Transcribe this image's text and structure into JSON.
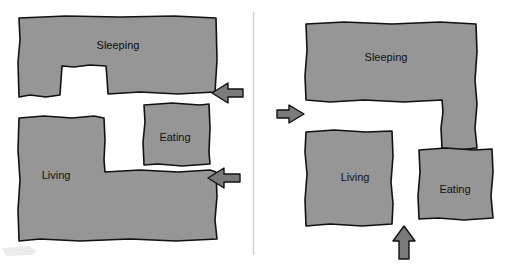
{
  "figure": {
    "background_color": "#ffffff",
    "room_fill_color": "#969696",
    "room_outline_color": "#111111",
    "arrow_fill_color": "#7a7a7a",
    "arrow_outline_color": "#111111",
    "divider_color": "#cfcfcf"
  },
  "panels": [
    {
      "id": "left-plan",
      "name": "Left floor plan",
      "rooms": [
        {
          "id": "sleeping",
          "label": "Sleeping",
          "label_x": 118,
          "label_y": 46
        },
        {
          "id": "eating",
          "label": "Eating",
          "label_x": 175,
          "label_y": 138
        },
        {
          "id": "living",
          "label": "Living",
          "label_x": 56,
          "label_y": 176
        }
      ],
      "entries": [
        {
          "id": "entry-upper",
          "direction": "left",
          "label_x": 227,
          "label_y": 93
        },
        {
          "id": "entry-lower",
          "direction": "left",
          "label_x": 224,
          "label_y": 178
        }
      ]
    },
    {
      "id": "right-plan",
      "name": "Right floor plan",
      "rooms": [
        {
          "id": "sleeping",
          "label": "Sleeping",
          "label_x": 386,
          "label_y": 58
        },
        {
          "id": "living",
          "label": "Living",
          "label_x": 355,
          "label_y": 178
        },
        {
          "id": "eating",
          "label": "Eating",
          "label_x": 455,
          "label_y": 190
        }
      ],
      "entries": [
        {
          "id": "entry-west",
          "direction": "right",
          "label_x": 295,
          "label_y": 114
        },
        {
          "id": "entry-south",
          "direction": "up",
          "label_x": 404,
          "label_y": 243
        }
      ]
    }
  ]
}
